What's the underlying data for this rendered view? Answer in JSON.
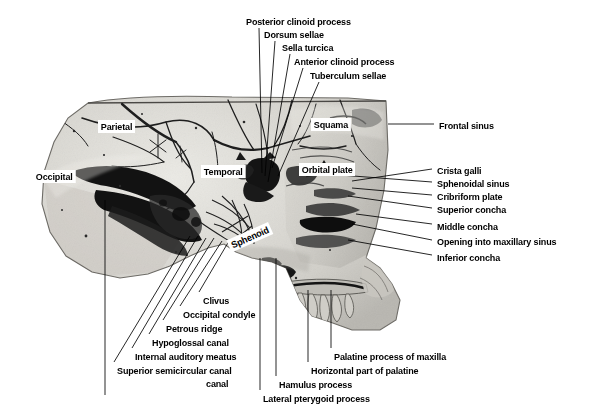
{
  "figure": {
    "specimen": "human skull, median sagittal section, interior view of right half",
    "background_color": "#ffffff",
    "bone_color": "#d8d6d0",
    "groove_color": "#1a1a1a",
    "leader_color": "#000000"
  },
  "top_labels": [
    {
      "text": "Posterior clinoid process",
      "x": 246,
      "y": 16
    },
    {
      "text": "Dorsum sellae",
      "x": 264,
      "y": 29
    },
    {
      "text": "Sella turcica",
      "x": 282,
      "y": 42
    },
    {
      "text": "Anterior clinoid process",
      "x": 294,
      "y": 56
    },
    {
      "text": "Tuberculum sellae",
      "x": 310,
      "y": 70
    }
  ],
  "right_labels": [
    {
      "text": "Frontal sinus",
      "x": 439,
      "y": 120
    },
    {
      "text": "Crista galli",
      "x": 437,
      "y": 165
    },
    {
      "text": "Sphenoidal sinus",
      "x": 437,
      "y": 178
    },
    {
      "text": "Cribriform plate",
      "x": 437,
      "y": 191
    },
    {
      "text": "Superior concha",
      "x": 437,
      "y": 204
    },
    {
      "text": "Middle concha",
      "x": 437,
      "y": 221
    },
    {
      "text": "Opening into maxillary sinus",
      "x": 437,
      "y": 236
    },
    {
      "text": "Inferior concha",
      "x": 437,
      "y": 252
    }
  ],
  "bottom_left_labels": [
    {
      "text": "Clivus",
      "x": 203,
      "y": 295
    },
    {
      "text": "Occipital condyle",
      "x": 183,
      "y": 309
    },
    {
      "text": "Petrous ridge",
      "x": 166,
      "y": 323
    },
    {
      "text": "Hypoglossal canal",
      "x": 152,
      "y": 337
    },
    {
      "text": "Internal auditory meatus",
      "x": 135,
      "y": 351
    },
    {
      "text": "Superior semicircular canal",
      "x": 117,
      "y": 365
    },
    {
      "text": "canal",
      "x": 206,
      "y": 378
    }
  ],
  "bottom_right_labels": [
    {
      "text": "Palatine process of maxilla",
      "x": 334,
      "y": 351
    },
    {
      "text": "Horizontal part of palatine",
      "x": 311,
      "y": 365
    },
    {
      "text": "Hamulus process",
      "x": 279,
      "y": 379
    },
    {
      "text": "Lateral pterygoid process",
      "x": 263,
      "y": 393
    }
  ],
  "boxed_labels": [
    {
      "text": "Parietal",
      "x": 98,
      "y": 120,
      "rotated": false
    },
    {
      "text": "Occipital",
      "x": 33,
      "y": 170,
      "rotated": false
    },
    {
      "text": "Temporal",
      "x": 201,
      "y": 165,
      "rotated": false
    },
    {
      "text": "Squama",
      "x": 311,
      "y": 118,
      "rotated": false
    },
    {
      "text": "Orbital plate",
      "x": 299,
      "y": 163,
      "rotated": false
    },
    {
      "text": "Sphenoid",
      "x": 229,
      "y": 240,
      "rotated": true
    }
  ],
  "leader_lines": {
    "top": [
      {
        "label": "Posterior clinoid process",
        "x1": 259,
        "y1": 28,
        "x2": 262,
        "y2": 173
      },
      {
        "label": "Dorsum sellae",
        "x1": 275,
        "y1": 41,
        "x2": 265,
        "y2": 176
      },
      {
        "label": "Sella turcica",
        "x1": 290,
        "y1": 54,
        "x2": 268,
        "y2": 182
      },
      {
        "label": "Anterior clinoid process",
        "x1": 303,
        "y1": 68,
        "x2": 272,
        "y2": 168
      },
      {
        "label": "Tuberculum sellae",
        "x1": 319,
        "y1": 82,
        "x2": 278,
        "y2": 176
      }
    ],
    "right": [
      {
        "label": "Frontal sinus",
        "x1": 434,
        "y1": 124,
        "x2": 388,
        "y2": 124
      },
      {
        "label": "Crista galli",
        "x1": 432,
        "y1": 169,
        "x2": 352,
        "y2": 181
      },
      {
        "label": "Sphenoidal sinus",
        "x1": 432,
        "y1": 182,
        "x2": 340,
        "y2": 175
      },
      {
        "label": "Cribriform plate",
        "x1": 432,
        "y1": 195,
        "x2": 352,
        "y2": 188
      },
      {
        "label": "Superior concha",
        "x1": 432,
        "y1": 208,
        "x2": 348,
        "y2": 196
      },
      {
        "label": "Middle concha",
        "x1": 432,
        "y1": 224,
        "x2": 356,
        "y2": 214
      },
      {
        "label": "Opening into maxillary sinus",
        "x1": 432,
        "y1": 240,
        "x2": 352,
        "y2": 224
      },
      {
        "label": "Inferior concha",
        "x1": 432,
        "y1": 255,
        "x2": 348,
        "y2": 240
      }
    ],
    "bottom_left": [
      {
        "label": "Clivus",
        "x1": 199,
        "y1": 292,
        "x2": 229,
        "y2": 241
      },
      {
        "label": "Occipital condyle",
        "x1": 180,
        "y1": 306,
        "x2": 222,
        "y2": 241
      },
      {
        "label": "Petrous ridge",
        "x1": 163,
        "y1": 320,
        "x2": 214,
        "y2": 238
      },
      {
        "label": "Hypoglossal canal",
        "x1": 149,
        "y1": 334,
        "x2": 206,
        "y2": 238
      },
      {
        "label": "Internal auditory meatus",
        "x1": 132,
        "y1": 348,
        "x2": 198,
        "y2": 236
      },
      {
        "label": "Superior semicircular canal",
        "x1": 114,
        "y1": 362,
        "x2": 190,
        "y2": 236
      },
      {
        "label": "canal",
        "x1": 105,
        "y1": 395,
        "x2": 105,
        "y2": 200
      }
    ],
    "bottom_right": [
      {
        "label": "Palatine process of maxilla",
        "x1": 331,
        "y1": 348,
        "x2": 331,
        "y2": 290
      },
      {
        "label": "Horizontal part of palatine",
        "x1": 308,
        "y1": 362,
        "x2": 308,
        "y2": 290
      },
      {
        "label": "Hamulus process",
        "x1": 276,
        "y1": 376,
        "x2": 276,
        "y2": 258
      },
      {
        "label": "Lateral pterygoid process",
        "x1": 260,
        "y1": 390,
        "x2": 260,
        "y2": 258
      }
    ]
  }
}
